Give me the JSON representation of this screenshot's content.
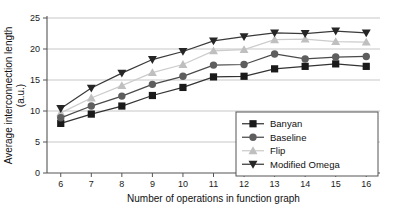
{
  "chart_data": {
    "type": "line",
    "title": "",
    "xlabel": "Number of operations in function graph",
    "ylabel": "Average interconnection length (a.u.)",
    "ylabel_line1": "Average interconnection length",
    "ylabel_line2": "(a.u.)",
    "x": [
      6,
      7,
      8,
      9,
      10,
      11,
      12,
      13,
      14,
      15,
      16
    ],
    "xtick_labels": [
      "6",
      "7",
      "8",
      "9",
      "10",
      "11",
      "12",
      "13",
      "14",
      "15",
      "16"
    ],
    "ytick_labels": [
      "0",
      "5",
      "10",
      "15",
      "20",
      "25"
    ],
    "ytick_values": [
      0,
      5,
      10,
      15,
      20,
      25
    ],
    "xlim": [
      5.55,
      16.45
    ],
    "ylim": [
      0,
      25
    ],
    "grid": "horizontal",
    "legend_position": "lower-right-inside",
    "series": [
      {
        "name": "Banyan",
        "marker": "square",
        "color": "#1a1a1a",
        "line_color": "#333333",
        "values": [
          8.0,
          9.5,
          10.8,
          12.5,
          13.8,
          15.5,
          15.6,
          16.8,
          17.2,
          17.6,
          17.2
        ]
      },
      {
        "name": "Baseline",
        "marker": "circle",
        "color": "#5e5e5e",
        "line_color": "#4a4a4a",
        "values": [
          8.9,
          10.8,
          12.4,
          14.3,
          15.6,
          17.4,
          17.5,
          19.2,
          18.4,
          18.7,
          18.8
        ]
      },
      {
        "name": "Flip",
        "marker": "triangle-up",
        "color": "#bfbfbf",
        "line_color": "#cccccc",
        "values": [
          9.7,
          12.1,
          14.1,
          16.2,
          17.5,
          19.7,
          19.9,
          21.5,
          21.6,
          21.2,
          21.1
        ]
      },
      {
        "name": "Modified Omega",
        "marker": "triangle-down",
        "color": "#262626",
        "line_color": "#3a3a3a",
        "values": [
          10.4,
          13.7,
          16.1,
          18.3,
          19.6,
          21.3,
          22.0,
          22.6,
          22.5,
          22.9,
          22.6
        ]
      }
    ]
  }
}
